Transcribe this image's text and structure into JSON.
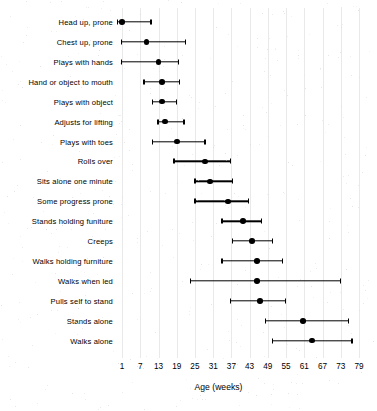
{
  "chart_data": {
    "type": "scatter",
    "title": "",
    "xlabel": "Age (weeks)",
    "ylabel": "",
    "xlim": [
      -2,
      82
    ],
    "xticks": [
      1,
      7,
      13,
      19,
      25,
      31,
      37,
      43,
      49,
      55,
      61,
      67,
      73,
      79
    ],
    "xticklabels": [
      "1",
      "7",
      "13",
      "19",
      "25",
      "31",
      "37",
      "43",
      "49",
      "55",
      "61",
      "67",
      "73",
      "79"
    ],
    "grid": true,
    "legend": false,
    "series_description": "Dot plot with horizontal range bars: point estimate (filled dot) and interval (line with end caps) for the age in weeks at which each motor milestone is attained.",
    "categories": [
      "Head up, prone",
      "Chest up, prone",
      "Plays with hands",
      "Hand or object to mouth",
      "Plays with object",
      "Adjusts for lifting",
      "Plays with toes",
      "Rolls over",
      "Sits alone one minute",
      "Some progress prone",
      "Stands holding funiture",
      "Creeps",
      "Walks holding furniture",
      "Walks when led",
      "Pulls self to stand",
      "Stands alone",
      "Walks alone"
    ],
    "points": [
      {
        "label": "Head up, prone",
        "value": 1,
        "low": -0.5,
        "high": 10.5
      },
      {
        "label": "Chest up, prone",
        "value": 9,
        "low": 0.7,
        "high": 22
      },
      {
        "label": "Plays with hands",
        "value": 13,
        "low": 0.7,
        "high": 19.5
      },
      {
        "label": "Hand or object to mouth",
        "value": 14.2,
        "low": 8.2,
        "high": 20
      },
      {
        "label": "Plays with object",
        "value": 14.2,
        "low": 11,
        "high": 19
      },
      {
        "label": "Adjusts for lifting",
        "value": 15.2,
        "low": 12.8,
        "high": 21.4
      },
      {
        "label": "Plays with toes",
        "value": 19.1,
        "low": 11,
        "high": 28.3
      },
      {
        "label": "Rolls over",
        "value": 28.3,
        "low": 18.1,
        "high": 36.6
      },
      {
        "label": "Sits alone one minute",
        "value": 29.9,
        "low": 25,
        "high": 37.3
      },
      {
        "label": "Some progress prone",
        "value": 35.9,
        "low": 25,
        "high": 42.5
      },
      {
        "label": "Stands holding funiture",
        "value": 40.8,
        "low": 33.9,
        "high": 47
      },
      {
        "label": "Creeps",
        "value": 43.8,
        "low": 37.3,
        "high": 50.4
      },
      {
        "label": "Walks holding furniture",
        "value": 45.4,
        "low": 33.9,
        "high": 53.7
      },
      {
        "label": "Walks when led",
        "value": 45.4,
        "low": 23.4,
        "high": 72.8
      },
      {
        "label": "Pulls self to stand",
        "value": 46.4,
        "low": 36.6,
        "high": 54.7
      },
      {
        "label": "Stands alone",
        "value": 60.5,
        "low": 48.1,
        "high": 75.4
      },
      {
        "label": "Walks alone",
        "value": 63.5,
        "low": 50.4,
        "high": 76.7
      }
    ]
  },
  "axis": {
    "x_title": "Age (weeks)"
  },
  "colors": {
    "point": "#000000",
    "line": "#000000",
    "grid": "#e9e9e9",
    "background": "#ffffff",
    "text": "#000000"
  }
}
